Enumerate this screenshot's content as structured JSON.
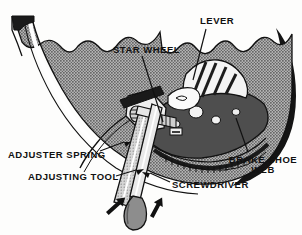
{
  "figure": {
    "kind": "technical-cutaway-illustration",
    "style": "black and white halftone line art"
  },
  "labels": [
    {
      "id": "lever",
      "text": "LEVER",
      "x": 200,
      "y": 16,
      "size": 9.5
    },
    {
      "id": "star-wheel",
      "text": "STAR WHEEL",
      "x": 113,
      "y": 45,
      "size": 9.5
    },
    {
      "id": "adjuster-spring",
      "text": "ADJUSTER SPRING",
      "x": 8,
      "y": 150,
      "size": 9.5
    },
    {
      "id": "adjusting-tool",
      "text": "ADJUSTING TOOL",
      "x": 28,
      "y": 172,
      "size": 9.5
    },
    {
      "id": "screwdriver",
      "text": "SCREWDRIVER",
      "x": 172,
      "y": 180,
      "size": 9.5
    },
    {
      "id": "brake-shoe-web",
      "text": "BRAKE SHOE\nWEB",
      "x": 228,
      "y": 155,
      "size": 9.5
    }
  ],
  "leader_lines": [
    {
      "id": "lever-leader",
      "from": [
        206,
        28
      ],
      "to": [
        192,
        78
      ]
    },
    {
      "id": "star-wheel-leader",
      "from": [
        143,
        56
      ],
      "to": [
        163,
        120
      ]
    },
    {
      "id": "adjuster-spring-leader",
      "from": [
        100,
        152
      ],
      "to": [
        122,
        143
      ]
    },
    {
      "id": "adjusting-tool-leader",
      "from": [
        116,
        176
      ],
      "to": [
        134,
        172
      ]
    },
    {
      "id": "screwdriver-leader",
      "from": [
        170,
        182
      ],
      "to": [
        148,
        172
      ]
    },
    {
      "id": "brake-shoe-web-leader",
      "from": [
        248,
        152
      ],
      "to": [
        236,
        118
      ]
    }
  ],
  "arrows": [
    {
      "id": "arrow-left",
      "x": 106,
      "y": 210,
      "angle": -40
    },
    {
      "id": "arrow-right",
      "x": 150,
      "y": 212,
      "angle": -25
    }
  ],
  "colors": {
    "ink": "#111111",
    "plate_fill": "#9a9a9a",
    "plate_texture": "#5e5e5e",
    "web_dark": "#4e4e4e",
    "rim_black": "#141414",
    "tool_gray": "#b9b9b9",
    "handle_gray": "#8d8d8d",
    "paper": "#fdfdfc",
    "highlight": "#ffffff"
  },
  "parts": [
    {
      "id": "backing-plate",
      "name": "brake backing plate"
    },
    {
      "id": "drum-rim",
      "name": "drum rim edge"
    },
    {
      "id": "star-wheel",
      "name": "star wheel adjuster"
    },
    {
      "id": "adjuster-screw",
      "name": "adjuster screw assembly"
    },
    {
      "id": "lever",
      "name": "adjuster lever"
    },
    {
      "id": "adjuster-spring",
      "name": "adjuster spring"
    },
    {
      "id": "brake-shoe-web",
      "name": "brake shoe web"
    },
    {
      "id": "shoe-rack",
      "name": "serrated shoe edge"
    },
    {
      "id": "adjusting-tool",
      "name": "adjusting tool (brake spoon)"
    },
    {
      "id": "screwdriver",
      "name": "screwdriver"
    }
  ]
}
